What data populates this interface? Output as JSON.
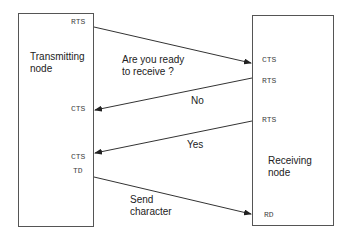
{
  "transmitting_node": {
    "title_line1": "Transmitting",
    "title_line2": "node",
    "signals": {
      "rts": "RTS",
      "cts_no": "CTS",
      "cts_yes": "CTS",
      "td": "TD"
    }
  },
  "receiving_node": {
    "title_line1": "Receiving",
    "title_line2": "node",
    "signals": {
      "cts": "CTS",
      "rts_no": "RTS",
      "rts_yes": "RTS",
      "rd": "RD"
    }
  },
  "messages": {
    "request_line1": "Are you ready",
    "request_line2": "to receive ?",
    "no": "No",
    "yes": "Yes",
    "send_line1": "Send",
    "send_line2": "character"
  },
  "colors": {
    "line": "#333333",
    "box_border": "#555555"
  }
}
